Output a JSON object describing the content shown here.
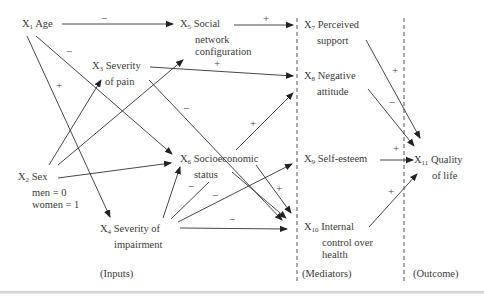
{
  "diagram": {
    "nodes": {
      "x1": {
        "var": "X",
        "sub": "1",
        "lines": [
          "Age"
        ]
      },
      "x2": {
        "var": "X",
        "sub": "2",
        "lines": [
          "Sex",
          "men = 0",
          "women = 1"
        ]
      },
      "x3": {
        "var": "X",
        "sub": "3",
        "lines": [
          "Severity",
          "of pain"
        ]
      },
      "x4": {
        "var": "X",
        "sub": "4",
        "lines": [
          "Severity of",
          "impairment"
        ]
      },
      "x5": {
        "var": "X",
        "sub": "5",
        "lines": [
          "Social",
          "network",
          "configuration"
        ]
      },
      "x6": {
        "var": "X",
        "sub": "6",
        "lines": [
          "Socioeconomic",
          "status"
        ]
      },
      "x7": {
        "var": "X",
        "sub": "7",
        "lines": [
          "Perceived",
          "support"
        ]
      },
      "x8": {
        "var": "X",
        "sub": "8",
        "lines": [
          "Negative",
          "attitude"
        ]
      },
      "x9": {
        "var": "X",
        "sub": "9",
        "lines": [
          "Self-esteem"
        ]
      },
      "x10": {
        "var": "X",
        "sub": "10",
        "lines": [
          "Internal",
          "control over",
          "health"
        ]
      },
      "x11": {
        "var": "X",
        "sub": "11",
        "lines": [
          "Quality",
          "of life"
        ]
      }
    },
    "sections": {
      "inputs": "(Inputs)",
      "mediators": "(Mediators)",
      "outcome": "(Outcome)"
    },
    "signs": {
      "x1_x5": "−",
      "x1_x6": "−",
      "x1_x4": "+",
      "x5_x7": "+",
      "x3_x8": "+",
      "x3_x10": "−",
      "x6_x8": "+",
      "x4_x6": "−",
      "x4_x9": "−",
      "x4_x10": "−",
      "x6_x10": "+",
      "x7_x11": "+",
      "x8_x11": "−",
      "x9_x11": "+",
      "x10_x11": "+"
    },
    "colors": {
      "line": "#333333",
      "text": "#3a3a3a",
      "divider": "#555555"
    }
  }
}
